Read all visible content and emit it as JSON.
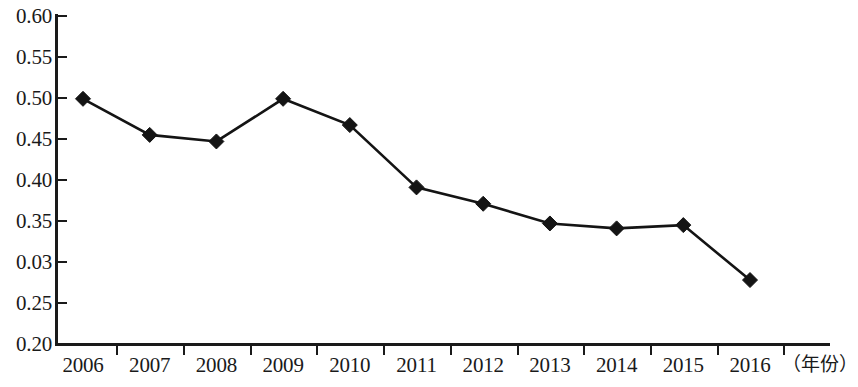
{
  "chart_data": {
    "type": "line",
    "title": "",
    "xlabel": "（年份）",
    "ylabel": "",
    "x": [
      "2006",
      "2007",
      "2008",
      "2009",
      "2010",
      "2011",
      "2012",
      "2013",
      "2014",
      "2015",
      "2016"
    ],
    "categories": [
      "2006",
      "2007",
      "2008",
      "2009",
      "2010",
      "2011",
      "2012",
      "2013",
      "2014",
      "2015",
      "2016"
    ],
    "values": [
      0.499,
      0.455,
      0.447,
      0.499,
      0.467,
      0.391,
      0.371,
      0.347,
      0.341,
      0.345,
      0.278
    ],
    "series": [
      {
        "name": "",
        "values": [
          0.499,
          0.455,
          0.447,
          0.499,
          0.467,
          0.391,
          0.371,
          0.347,
          0.341,
          0.345,
          0.278
        ]
      }
    ],
    "ylim": [
      0.2,
      0.6
    ],
    "y_tick_labels": [
      "0.60",
      "0.55",
      "0.50",
      "0.45",
      "0.40",
      "0.35",
      "0.03",
      "0.25",
      "0.20"
    ],
    "y_tick_values": [
      0.6,
      0.55,
      0.5,
      0.45,
      0.4,
      0.35,
      0.3,
      0.25,
      0.2
    ],
    "grid": false,
    "legend": "none",
    "marker": "diamond",
    "line_color": "#141414",
    "marker_color": "#141414"
  }
}
